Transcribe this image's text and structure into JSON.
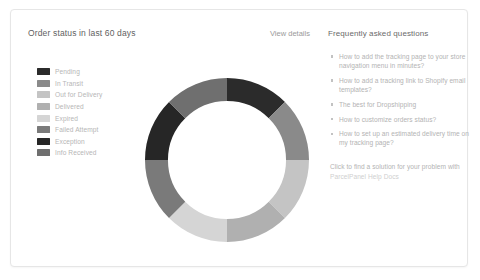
{
  "card": {
    "background": "#ffffff",
    "border_color": "#e6e6e6"
  },
  "order_status_panel": {
    "title": "Order status in last 60 days",
    "view_details_label": "View details",
    "legend": [
      {
        "label": "Pending",
        "color": "#2b2b2b"
      },
      {
        "label": "In Transit",
        "color": "#8a8a8a"
      },
      {
        "label": "Out for Delivery",
        "color": "#c4c4c4"
      },
      {
        "label": "Delivered",
        "color": "#b0b0b0"
      },
      {
        "label": "Expired",
        "color": "#d5d5d5"
      },
      {
        "label": "Failed Attempt",
        "color": "#7a7a7a"
      },
      {
        "label": "Exception",
        "color": "#262626"
      },
      {
        "label": "Info Received",
        "color": "#6f6f6f"
      }
    ]
  },
  "chart_data": {
    "type": "pie",
    "variant": "donut",
    "title": "Order status in last 60 days",
    "categories": [
      "Pending",
      "In Transit",
      "Out for Delivery",
      "Delivered",
      "Expired",
      "Failed Attempt",
      "Exception",
      "Info Received"
    ],
    "values": [
      12.5,
      12.5,
      12.5,
      12.5,
      12.5,
      12.5,
      12.5,
      12.5
    ],
    "colors": [
      "#2b2b2b",
      "#8a8a8a",
      "#c4c4c4",
      "#b0b0b0",
      "#d5d5d5",
      "#7a7a7a",
      "#262626",
      "#6f6f6f"
    ],
    "unit": "percent",
    "start_angle": 0,
    "inner_radius_ratio": 0.72,
    "legend_position": "left",
    "grid": false
  },
  "faq_panel": {
    "title": "Frequently asked questions",
    "items": [
      "How to add the tracking page to your store navigation menu in minutes?",
      "How to add a tracking link to Shopify email templates?",
      "The best for Dropshipping",
      "How to customize orders status?",
      "How to set up an estimated delivery time on my tracking page?"
    ],
    "footer_text": "Click to find a solution for your problem with ",
    "footer_link": "ParcelPanel Help Docs"
  }
}
